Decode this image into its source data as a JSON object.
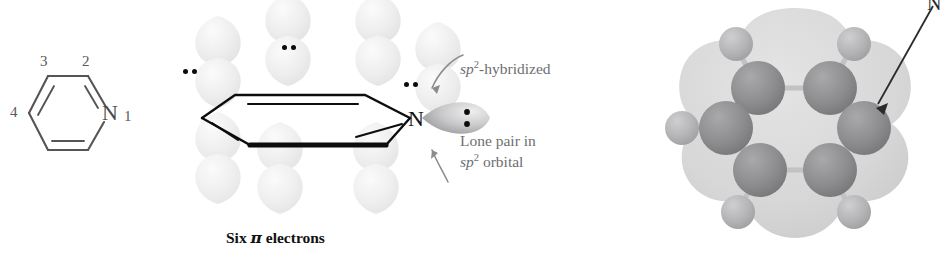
{
  "figure": {
    "background": "#ffffff"
  },
  "skeletal": {
    "name": "pyridine-skeletal-structure",
    "atom_label": "N",
    "positions": [
      {
        "number": "1",
        "label": "1"
      },
      {
        "number": "2",
        "label": "2"
      },
      {
        "number": "3",
        "label": "3"
      },
      {
        "number": "4",
        "label": "4"
      }
    ],
    "bond_color": "#555557",
    "text_color": "#58585a"
  },
  "orbitals": {
    "name": "pi-orbital-diagram",
    "ring_atom_label": "N",
    "lone_pair_count": 3,
    "annotations": [
      {
        "id": "sp2-hybridized",
        "text_plain": "sp2-hybridized",
        "line1_prefix_italic": "sp",
        "line1_sup": "2",
        "line1_rest": "-hybridized"
      },
      {
        "id": "lone-pair-sp2-orbital",
        "line1": "Lone pair in",
        "line2_prefix_italic": "sp",
        "line2_sup": "2",
        "line2_rest": " orbital"
      }
    ],
    "caption": {
      "before": "Six ",
      "symbol": "π",
      "after": " electrons",
      "full": "Six π electrons"
    },
    "lobe_color": "#ededee",
    "dot_color": "#0b0b0b",
    "label_color": "#6e6e70"
  },
  "model": {
    "name": "space-filling-model",
    "pointer_label": "N",
    "carbon_count": 5,
    "nitrogen_count": 1,
    "hydrogen_count": 5,
    "colors": {
      "envelope": "#d9d9d9",
      "carbon": "#8e8e90",
      "nitrogen": "#8e8e90",
      "hydrogen": "#b4b4b6",
      "bond": "#c4c4c6",
      "arrow": "#2b2b2b"
    }
  }
}
